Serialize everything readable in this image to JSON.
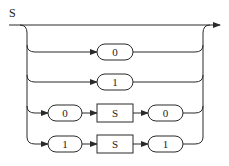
{
  "diagram": {
    "type": "railroad-syntax-diagram",
    "rule_name": "S",
    "alternatives": [
      {
        "label": "empty",
        "sequence": []
      },
      {
        "label": "terminal-0",
        "sequence": [
          {
            "kind": "terminal",
            "text": "0"
          }
        ]
      },
      {
        "label": "terminal-1",
        "sequence": [
          {
            "kind": "terminal",
            "text": "1"
          }
        ]
      },
      {
        "label": "0-S-0",
        "sequence": [
          {
            "kind": "terminal",
            "text": "0"
          },
          {
            "kind": "nonterminal",
            "text": "S"
          },
          {
            "kind": "terminal",
            "text": "0"
          }
        ]
      },
      {
        "label": "1-S-1",
        "sequence": [
          {
            "kind": "terminal",
            "text": "1"
          },
          {
            "kind": "nonterminal",
            "text": "S"
          },
          {
            "kind": "terminal",
            "text": "1"
          }
        ]
      }
    ],
    "colors": {
      "line": "#2a2a2a",
      "background": "#ffffff"
    }
  }
}
